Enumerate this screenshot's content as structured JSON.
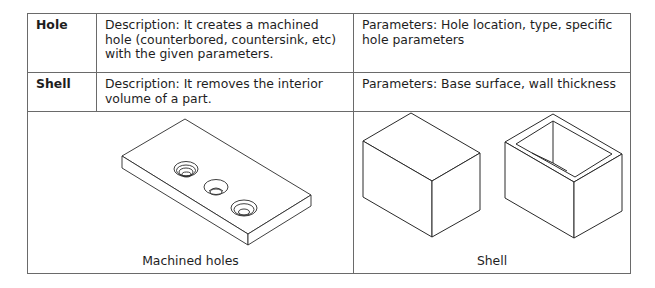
{
  "table": {
    "rows": [
      {
        "name": "Hole",
        "description": "Description: It creates a machined hole (counterbored, countersink, etc) with the given parameters.",
        "parameters": "Parameters: Hole location, type, specific hole parameters"
      },
      {
        "name": "Shell",
        "description": "Description: It removes the interior volume of a part.",
        "parameters": "Parameters: Base surface, wall thickness"
      }
    ],
    "figures": [
      {
        "caption": "Machined holes",
        "illustration": "plate-with-three-holes"
      },
      {
        "caption": "Shell",
        "illustration": "solid-box-and-shelled-box"
      }
    ]
  }
}
